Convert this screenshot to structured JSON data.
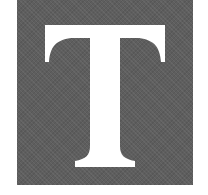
{
  "dropcap": {
    "letter": "T",
    "background_color": "#5e5e5e",
    "letter_color": "#ffffff"
  }
}
